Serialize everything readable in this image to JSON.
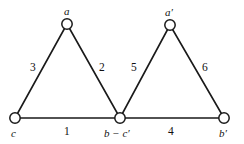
{
  "figure": {
    "type": "graph-diagram",
    "background_color": "#ffffff",
    "line_color": "#1a1a1a",
    "vertex_fill_color": "#ffffff"
  },
  "vertices": [
    {
      "id": "a",
      "label": "a",
      "x": 67,
      "y": 24,
      "label_x": 64,
      "label_y": 6,
      "radius": 5.2
    },
    {
      "id": "a-prime",
      "label": "a′",
      "x": 170,
      "y": 25,
      "label_x": 165,
      "label_y": 7,
      "radius": 5.2
    },
    {
      "id": "c",
      "label": "c",
      "x": 15,
      "y": 118,
      "label_x": 11,
      "label_y": 128,
      "radius": 5.2
    },
    {
      "id": "b-minus-c-prime",
      "label": "b − c′",
      "x": 120,
      "y": 118,
      "label_x": 104,
      "label_y": 128,
      "radius": 5.2
    },
    {
      "id": "b-prime",
      "label": "b′",
      "x": 224,
      "y": 118,
      "label_x": 219,
      "label_y": 128,
      "radius": 5.2
    }
  ],
  "edges": [
    {
      "id": "edge-1",
      "label": "1",
      "from": "c",
      "to": "b-minus-c-prime",
      "label_x": 64,
      "label_y": 126
    },
    {
      "id": "edge-2",
      "label": "2",
      "from": "a",
      "to": "b-minus-c-prime",
      "label_x": 99,
      "label_y": 62
    },
    {
      "id": "edge-3",
      "label": "3",
      "from": "c",
      "to": "a",
      "label_x": 30,
      "label_y": 62
    },
    {
      "id": "edge-4",
      "label": "4",
      "from": "b-minus-c-prime",
      "to": "b-prime",
      "label_x": 168,
      "label_y": 126
    },
    {
      "id": "edge-5",
      "label": "5",
      "from": "b-minus-c-prime",
      "to": "a-prime",
      "label_x": 131,
      "label_y": 62
    },
    {
      "id": "edge-6",
      "label": "6",
      "from": "a-prime",
      "to": "b-prime",
      "label_x": 202,
      "label_y": 62
    }
  ]
}
